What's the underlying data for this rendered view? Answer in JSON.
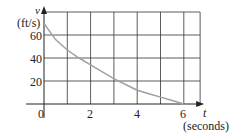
{
  "chart_data": {
    "type": "line",
    "title": "",
    "xlabel": "t",
    "xlabel_unit": "(seconds)",
    "ylabel": "v",
    "ylabel_unit": "(ft/s)",
    "xlim": [
      0,
      7
    ],
    "ylim": [
      0,
      80
    ],
    "x_ticks": [
      0,
      2,
      4,
      6
    ],
    "x_tick_labels": [
      "2",
      "4",
      "6"
    ],
    "y_ticks": [
      20,
      40,
      60
    ],
    "y_tick_labels": [
      "20",
      "40",
      "60"
    ],
    "origin_label": "0",
    "grid": true,
    "grid_x_step": 1,
    "grid_y_step": 20,
    "legend": null,
    "series": [
      {
        "name": "v(t)",
        "color": "#a0a0a0",
        "x": [
          0,
          0.5,
          1,
          1.5,
          2,
          2.5,
          3,
          3.5,
          4,
          4.5,
          5,
          5.5,
          6
        ],
        "values": [
          70,
          56,
          47,
          40,
          34,
          28,
          22,
          17,
          12,
          9,
          6,
          3,
          0
        ]
      }
    ]
  },
  "labels": {
    "y_axis_var": "v",
    "y_axis_unit": "(ft/s)",
    "x_axis_var": "t",
    "x_axis_unit": "(seconds)",
    "origin": "0",
    "y60": "60",
    "y40": "40",
    "y20": "20",
    "x2": "2",
    "x4": "4",
    "x6": "6"
  }
}
